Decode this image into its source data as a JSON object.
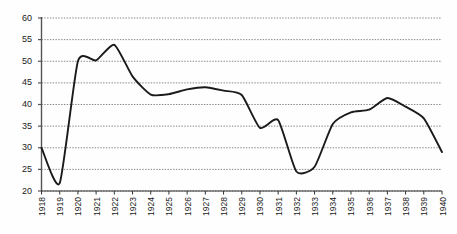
{
  "chart_data": {
    "type": "line",
    "title": "",
    "subtitle": "",
    "xlabel": "",
    "ylabel": "",
    "xlim": [
      1918,
      1940
    ],
    "ylim": [
      20,
      60
    ],
    "yticks": [
      20,
      25,
      30,
      35,
      40,
      45,
      50,
      55,
      60
    ],
    "grid": true,
    "grid_style": "dotted-horizontal",
    "legend": false,
    "legend_position": "none",
    "line_color": "#1a1a1a",
    "categories": [
      "1918",
      "1919",
      "1920",
      "1921",
      "1922",
      "1923",
      "1924",
      "1925",
      "1926",
      "1927",
      "1928",
      "1929",
      "1930",
      "1931",
      "1932",
      "1933",
      "1934",
      "1935",
      "1936",
      "1937",
      "1938",
      "1939",
      "1940"
    ],
    "values": [
      30.0,
      21.8,
      50.0,
      50.2,
      53.8,
      46.5,
      42.3,
      42.4,
      43.5,
      44.0,
      43.2,
      42.2,
      34.6,
      36.4,
      24.5,
      25.6,
      35.5,
      38.2,
      38.8,
      41.5,
      39.5,
      36.8,
      29.0
    ],
    "series": [
      {
        "name": "series-1",
        "values": [
          30.0,
          21.8,
          50.0,
          50.2,
          53.8,
          46.5,
          42.3,
          42.4,
          43.5,
          44.0,
          43.2,
          42.2,
          34.6,
          36.4,
          24.5,
          25.6,
          35.5,
          38.2,
          38.8,
          41.5,
          39.5,
          36.8,
          29.0
        ]
      }
    ],
    "annotations": []
  }
}
